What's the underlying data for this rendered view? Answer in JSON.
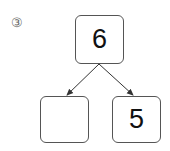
{
  "problem_label": "③",
  "number_bond": {
    "whole": "6",
    "part_left": "",
    "part_right": "5"
  }
}
